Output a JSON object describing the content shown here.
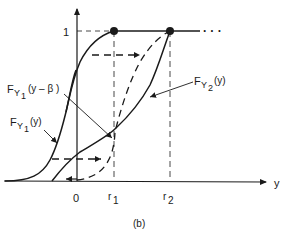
{
  "figure": {
    "caption": "(b)",
    "axis_x_label": "y",
    "axis_y_tick": "1",
    "x_ticks": {
      "zero": "0",
      "r1_base": "r",
      "r1_sub": "1",
      "r2_base": "r",
      "r2_sub": "2"
    },
    "ellipsis": "· · ·",
    "curves": [
      {
        "name": "F_Y1(y)",
        "base": "F",
        "sub": "Y",
        "subsub": "1",
        "arg": "(y)"
      },
      {
        "name": "F_Y1(y - beta)",
        "base": "F",
        "sub": "Y",
        "subsub": "1",
        "arg": "(y – β )"
      },
      {
        "name": "F_Y2(y)",
        "base": "F",
        "sub": "Y",
        "subsub": "2",
        "arg": "(y)"
      }
    ],
    "colors": {
      "ink": "#1a1a1a",
      "background": "#ffffff"
    }
  }
}
